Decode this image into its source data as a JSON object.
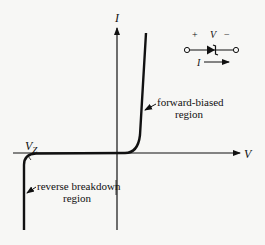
{
  "diagram": {
    "axes": {
      "x_label": "V",
      "y_label": "I"
    },
    "annotations": {
      "zener_voltage": "V",
      "zener_voltage_subscript": "Z",
      "forward_line1": "forward-biased",
      "forward_line2": "region",
      "reverse_line1": "reverse breakdown",
      "reverse_line2": "region"
    },
    "symbol": {
      "plus": "+",
      "voltage": "V",
      "minus": "−",
      "current": "I"
    },
    "colors": {
      "ink": "#111111",
      "background": "#f7f7f5"
    }
  }
}
